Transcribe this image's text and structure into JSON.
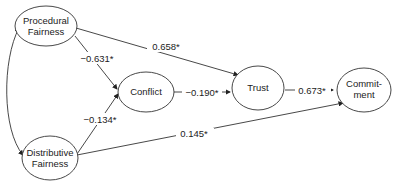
{
  "diagram": {
    "type": "path-model",
    "nodes": [
      {
        "id": "procedural",
        "line1": "Procedural",
        "line2": "Fairness"
      },
      {
        "id": "distributive",
        "line1": "Distributive",
        "line2": "Fairness"
      },
      {
        "id": "conflict",
        "line1": "Conflict",
        "line2": ""
      },
      {
        "id": "trust",
        "line1": "Trust",
        "line2": ""
      },
      {
        "id": "commitment",
        "line1": "Commit-",
        "line2": "ment"
      }
    ],
    "edges": [
      {
        "from": "procedural",
        "to": "trust",
        "label": "0.658*"
      },
      {
        "from": "procedural",
        "to": "conflict",
        "label": "−0.631*"
      },
      {
        "from": "distributive",
        "to": "conflict",
        "label": "−0.134*"
      },
      {
        "from": "conflict",
        "to": "trust",
        "label": "−0.190*"
      },
      {
        "from": "trust",
        "to": "commitment",
        "label": "0.673*"
      },
      {
        "from": "distributive",
        "to": "commitment",
        "label": "0.145*"
      },
      {
        "from": "procedural",
        "to": "distributive",
        "label": "",
        "bidirectional": true
      }
    ]
  }
}
